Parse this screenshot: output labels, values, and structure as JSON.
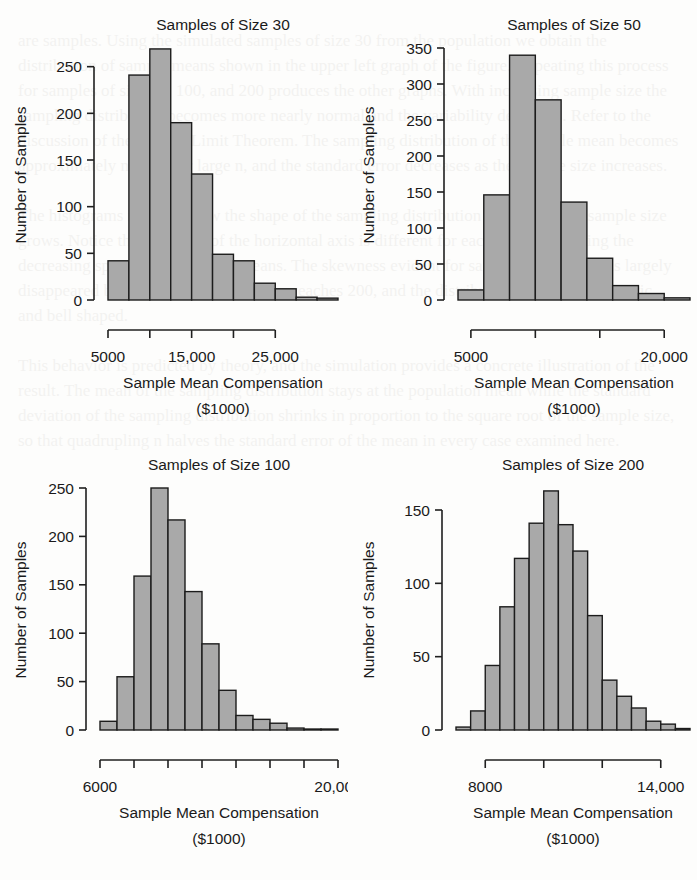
{
  "figure": {
    "background_color": "#fdfdfc",
    "bar_fill_color": "#a9a9a9",
    "bar_stroke_color": "#1c1c1c",
    "axis_color": "#1f1f1f",
    "text_color": "#1a1a1a"
  },
  "ghost_text": "are samples. Using the simulated samples of size 30 from the population we obtain the distribution of sample means shown in the upper left graph of the figure. Repeating this process for samples of size 50, 100, and 200 produces the other graphs. With increasing sample size the sampling distribution becomes more nearly normal and the variability decreases. Refer to the discussion of the Central Limit Theorem. The sampling distribution of the sample mean becomes approximately normal for large n, and the standard error decreases as the sample size increases.\n\nThe histograms illustrate how the shape of the sampling distribution changes as the sample size grows. Notice that the scale of the horizontal axis is different for each graph, reflecting the decreasing spread of the sample means. The skewness evident for samples of size 30 has largely disappeared by the time the sample size reaches 200, and the distribution is nearly symmetric and bell shaped.\n\nThis behavior is predicted by theory, and the simulation provides a concrete illustration of the result. The mean of the sampling distribution stays at the population mean while the standard deviation of the sampling distribution shrinks in proportion to the square root of the sample size, so that quadrupling n halves the standard error of the mean in every case examined here.",
  "panels": [
    {
      "id": "panel-size-30",
      "title": "Samples of Size 30",
      "xlabel_line1": "Sample Mean Compensation",
      "xlabel_line2": "($1000)",
      "ylabel": "Number of Samples"
    },
    {
      "id": "panel-size-50",
      "title": "Samples of Size 50",
      "xlabel_line1": "Sample Mean Compensation",
      "xlabel_line2": "($1000)",
      "ylabel": "Number of Samples"
    },
    {
      "id": "panel-size-100",
      "title": "Samples of Size 100",
      "xlabel_line1": "Sample Mean Compensation",
      "xlabel_line2": "($1000)",
      "ylabel": "Number of Samples"
    },
    {
      "id": "panel-size-200",
      "title": "Samples of Size 200",
      "xlabel_line1": "Sample Mean Compensation",
      "xlabel_line2": "($1000)",
      "ylabel": "Number of Samples"
    }
  ],
  "chart_data": [
    {
      "type": "bar",
      "title": "Samples of Size 30",
      "xlabel": "Sample Mean Compensation ($1000)",
      "ylabel": "Number of Samples",
      "bin_width": 2500,
      "bin_starts": [
        5000,
        7500,
        10000,
        12500,
        15000,
        17500,
        20000,
        22500,
        25000,
        27500,
        30000
      ],
      "categories": [
        "5000-7500",
        "7500-10000",
        "10000-12500",
        "12500-15000",
        "15000-17500",
        "17500-20000",
        "20000-22500",
        "22500-25000",
        "25000-27500",
        "27500-30000",
        "30000-32500"
      ],
      "values": [
        42,
        241,
        269,
        190,
        135,
        49,
        42,
        18,
        12,
        3,
        2
      ],
      "xlim": [
        5000,
        32500
      ],
      "ylim": [
        0,
        270
      ],
      "yticks": [
        0,
        50,
        100,
        150,
        200,
        250
      ],
      "ytick_labels": [
        "0",
        "50",
        "100",
        "150",
        "200",
        "250"
      ],
      "xticks": [
        5000,
        10000,
        15000,
        20000,
        25000
      ],
      "xtick_labels": [
        "5000",
        "",
        "15,000",
        "",
        "25,000"
      ],
      "grid": false,
      "legend": "none"
    },
    {
      "type": "bar",
      "title": "Samples of Size 50",
      "xlabel": "Sample Mean Compensation ($1000)",
      "ylabel": "Number of Samples",
      "bin_width": 2000,
      "bin_starts": [
        4000,
        6000,
        8000,
        10000,
        12000,
        14000,
        16000,
        18000,
        20000
      ],
      "categories": [
        "4000-6000",
        "6000-8000",
        "8000-10000",
        "10000-12000",
        "12000-14000",
        "14000-16000",
        "16000-18000",
        "18000-20000",
        "20000-22000"
      ],
      "values": [
        14,
        146,
        340,
        278,
        136,
        58,
        20,
        9,
        3
      ],
      "xlim": [
        4000,
        22000
      ],
      "ylim": [
        0,
        350
      ],
      "yticks": [
        0,
        50,
        100,
        150,
        200,
        250,
        300,
        350
      ],
      "ytick_labels": [
        "0",
        "50",
        "100",
        "150",
        "200",
        "250",
        "300",
        "350"
      ],
      "xticks": [
        5000,
        10000,
        15000,
        20000
      ],
      "xtick_labels": [
        "5000",
        "",
        "",
        "20,000"
      ],
      "grid": false,
      "legend": "none"
    },
    {
      "type": "bar",
      "title": "Samples of Size 100",
      "xlabel": "Sample Mean Compensation ($1000)",
      "ylabel": "Number of Samples",
      "bin_width": 1000,
      "bin_starts": [
        6000,
        7000,
        8000,
        9000,
        10000,
        11000,
        12000,
        13000,
        14000,
        15000,
        16000,
        17000,
        18000,
        19000
      ],
      "categories": [
        "6000-7000",
        "7000-8000",
        "8000-9000",
        "9000-10000",
        "10000-11000",
        "11000-12000",
        "12000-13000",
        "13000-14000",
        "14000-15000",
        "15000-16000",
        "16000-17000",
        "17000-18000",
        "18000-19000",
        "19000-20000"
      ],
      "values": [
        9,
        55,
        159,
        250,
        217,
        143,
        89,
        41,
        15,
        11,
        7,
        2,
        1,
        1
      ],
      "xlim": [
        6000,
        20000
      ],
      "ylim": [
        0,
        250
      ],
      "yticks": [
        0,
        50,
        100,
        150,
        200,
        250
      ],
      "ytick_labels": [
        "0",
        "50",
        "100",
        "150",
        "200",
        "250"
      ],
      "xticks": [
        6000,
        8000,
        10000,
        12000,
        14000,
        16000,
        18000,
        20000
      ],
      "xtick_labels": [
        "6000",
        "",
        "",
        "",
        "",
        "",
        "",
        "20,000"
      ],
      "grid": false,
      "legend": "none"
    },
    {
      "type": "bar",
      "title": "Samples of Size 200",
      "xlabel": "Sample Mean Compensation ($1000)",
      "ylabel": "Number of Samples",
      "bin_width": 500,
      "bin_starts": [
        7000,
        7500,
        8000,
        8500,
        9000,
        9500,
        10000,
        10500,
        11000,
        11500,
        12000,
        12500,
        13000,
        13500,
        14000,
        14500
      ],
      "categories": [
        "7000-7500",
        "7500-8000",
        "8000-8500",
        "8500-9000",
        "9000-9500",
        "9500-10000",
        "10000-10500",
        "10500-11000",
        "11000-11500",
        "11500-12000",
        "12000-12500",
        "12500-13000",
        "13000-13500",
        "13500-14000",
        "14000-14500",
        "14500-15000"
      ],
      "values": [
        2,
        13,
        44,
        84,
        117,
        141,
        163,
        140,
        122,
        78,
        34,
        23,
        15,
        6,
        4,
        1
      ],
      "xlim": [
        7000,
        15000
      ],
      "ylim": [
        0,
        165
      ],
      "yticks": [
        0,
        50,
        100,
        150
      ],
      "ytick_labels": [
        "0",
        "50",
        "100",
        "150"
      ],
      "xticks": [
        8000,
        10000,
        12000,
        14000
      ],
      "xtick_labels": [
        "8000",
        "",
        "",
        "14,000"
      ],
      "grid": false,
      "legend": "none"
    }
  ]
}
